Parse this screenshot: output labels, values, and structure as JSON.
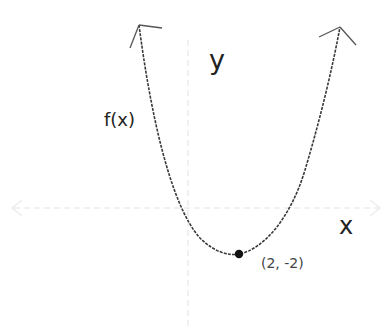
{
  "diagram": {
    "labels": {
      "y_axis": "y",
      "x_axis": "x",
      "function": "f(x)",
      "vertex": "(2, -2)"
    },
    "colors": {
      "curve": "#3a3a3a",
      "axes": "#ececec",
      "vertex_dot": "#111111",
      "text": "#222222"
    },
    "vertex": {
      "x": 2,
      "y": -2
    },
    "curve_type": "upward-opening parabola",
    "arrows": [
      "curve-left-end",
      "curve-right-end",
      "x-axis-both-ends",
      "y-axis-top"
    ]
  }
}
